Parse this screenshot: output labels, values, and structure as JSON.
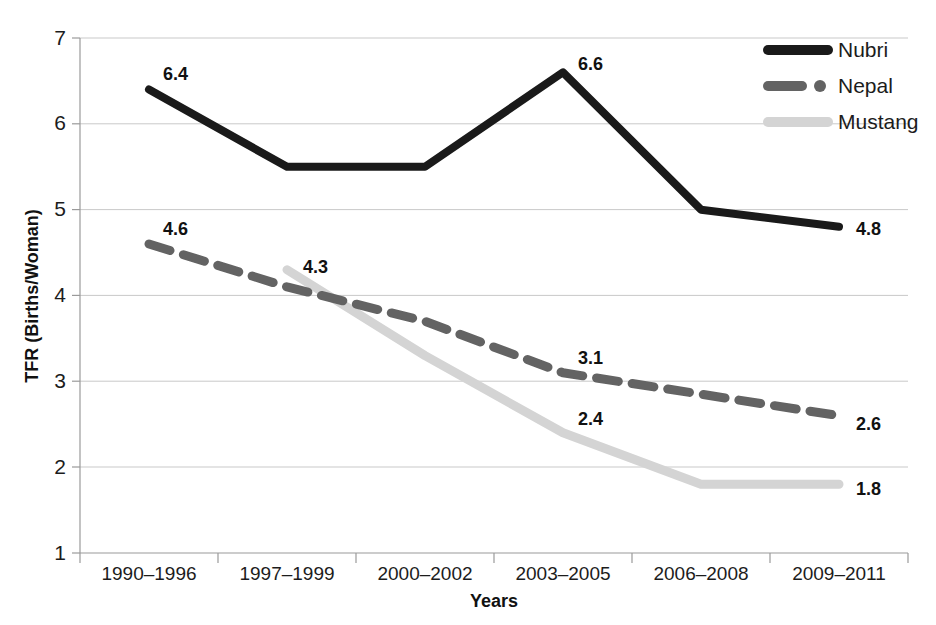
{
  "chart_data": {
    "type": "line",
    "title": "",
    "xlabel": "Years",
    "ylabel": "TFR (Births/Woman)",
    "categories": [
      "1990–1996",
      "1997–1999",
      "2000–2002",
      "2003–2005",
      "2006–2008",
      "2009–2011"
    ],
    "ylim": [
      1,
      7
    ],
    "yticks": [
      "1",
      "2",
      "3",
      "4",
      "5",
      "6",
      "7"
    ],
    "grid": true,
    "legend_position": "top-right",
    "series": [
      {
        "name": "Nubri",
        "style": "solid",
        "color": "#1a1a1a",
        "values": [
          6.4,
          5.5,
          5.5,
          6.6,
          5.0,
          4.8
        ],
        "labels": [
          {
            "index": 0,
            "text": "6.4"
          },
          {
            "index": 3,
            "text": "6.6"
          },
          {
            "index": 5,
            "text": "4.8"
          }
        ]
      },
      {
        "name": "Nepal",
        "style": "dashed",
        "color": "#636363",
        "values": [
          4.6,
          4.1,
          3.7,
          3.1,
          2.85,
          2.6
        ],
        "labels": [
          {
            "index": 0,
            "text": "4.6"
          },
          {
            "index": 3,
            "text": "3.1"
          },
          {
            "index": 5,
            "text": "2.6"
          }
        ]
      },
      {
        "name": "Mustang",
        "style": "solid",
        "color": "#d4d4d4",
        "values": [
          null,
          4.3,
          3.3,
          2.4,
          1.8,
          1.8
        ],
        "labels": [
          {
            "index": 1,
            "text": "4.3"
          },
          {
            "index": 3,
            "text": "2.4"
          },
          {
            "index": 5,
            "text": "1.8"
          }
        ]
      }
    ]
  },
  "axes": {
    "y_tick_1": "1",
    "y_tick_2": "2",
    "y_tick_3": "3",
    "y_tick_4": "4",
    "y_tick_5": "5",
    "y_tick_6": "6",
    "y_tick_7": "7",
    "x_tick_0": "1990–1996",
    "x_tick_1": "1997–1999",
    "x_tick_2": "2000–2002",
    "x_tick_3": "2003–2005",
    "x_tick_4": "2006–2008",
    "x_tick_5": "2009–2011",
    "x_axis_title": "Years",
    "y_axis_title": "TFR (Births/Woman)"
  },
  "legend": {
    "items": [
      {
        "label": "Nubri"
      },
      {
        "label": "Nepal"
      },
      {
        "label": "Mustang"
      }
    ]
  },
  "data_labels": {
    "nubri_first": "6.4",
    "nubri_peak": "6.6",
    "nubri_last": "4.8",
    "nepal_first": "4.6",
    "nepal_mid": "3.1",
    "nepal_last": "2.6",
    "mustang_first": "4.3",
    "mustang_mid": "2.4",
    "mustang_last": "1.8"
  },
  "colors": {
    "nubri": "#1a1a1a",
    "nepal": "#636363",
    "mustang": "#d4d4d4",
    "grid": "#c9c9c9",
    "axis": "#9a9a9a",
    "background": "#ffffff"
  }
}
